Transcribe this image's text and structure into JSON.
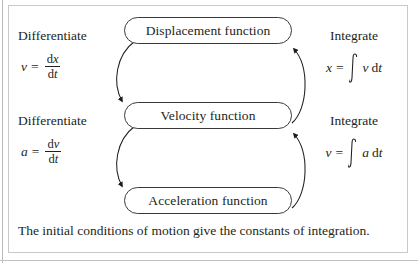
{
  "figure": {
    "caption": "The initial conditions of motion give the constants of integration.",
    "background_color": "#ffffff",
    "ink_color": "#231f20",
    "frame_color": "#c9c9c9"
  },
  "nodes": [
    {
      "id": "displacement",
      "label": "Displacement function"
    },
    {
      "id": "velocity",
      "label": "Velocity function"
    },
    {
      "id": "acceleration",
      "label": "Acceleration function"
    }
  ],
  "left_column": [
    {
      "id": "differentiate-displacement-to-velocity",
      "caption": "Differentiate",
      "formula": {
        "lhs": "v",
        "relation": "=",
        "numerator_d": "d",
        "numerator_var": "x",
        "denominator_d": "d",
        "denominator_var": "t",
        "plain": "v = dx/dt"
      }
    },
    {
      "id": "differentiate-velocity-to-acceleration",
      "caption": "Differentiate",
      "formula": {
        "lhs": "a",
        "relation": "=",
        "numerator_d": "d",
        "numerator_var": "v",
        "denominator_d": "d",
        "denominator_var": "t",
        "plain": "a = dv/dt"
      }
    }
  ],
  "right_column": [
    {
      "id": "integrate-velocity-to-displacement",
      "caption": "Integrate",
      "formula": {
        "lhs": "x",
        "relation": "=",
        "integral_sign": "∫",
        "integrand": "v",
        "differential_d": "d",
        "differential_var": "t",
        "plain": "x = ∫ v dt"
      }
    },
    {
      "id": "integrate-acceleration-to-velocity",
      "caption": "Integrate",
      "formula": {
        "lhs": "v",
        "relation": "=",
        "integral_sign": "∫",
        "integrand": "a",
        "differential_d": "d",
        "differential_var": "t",
        "plain": "v = ∫ a dt"
      }
    }
  ],
  "arrows": [
    {
      "id": "displacement-to-velocity",
      "direction": "down",
      "side": "left",
      "operation": "Differentiate"
    },
    {
      "id": "velocity-to-displacement",
      "direction": "up",
      "side": "right",
      "operation": "Integrate"
    },
    {
      "id": "velocity-to-acceleration",
      "direction": "down",
      "side": "left",
      "operation": "Differentiate"
    },
    {
      "id": "acceleration-to-velocity",
      "direction": "up",
      "side": "right",
      "operation": "Integrate"
    }
  ]
}
